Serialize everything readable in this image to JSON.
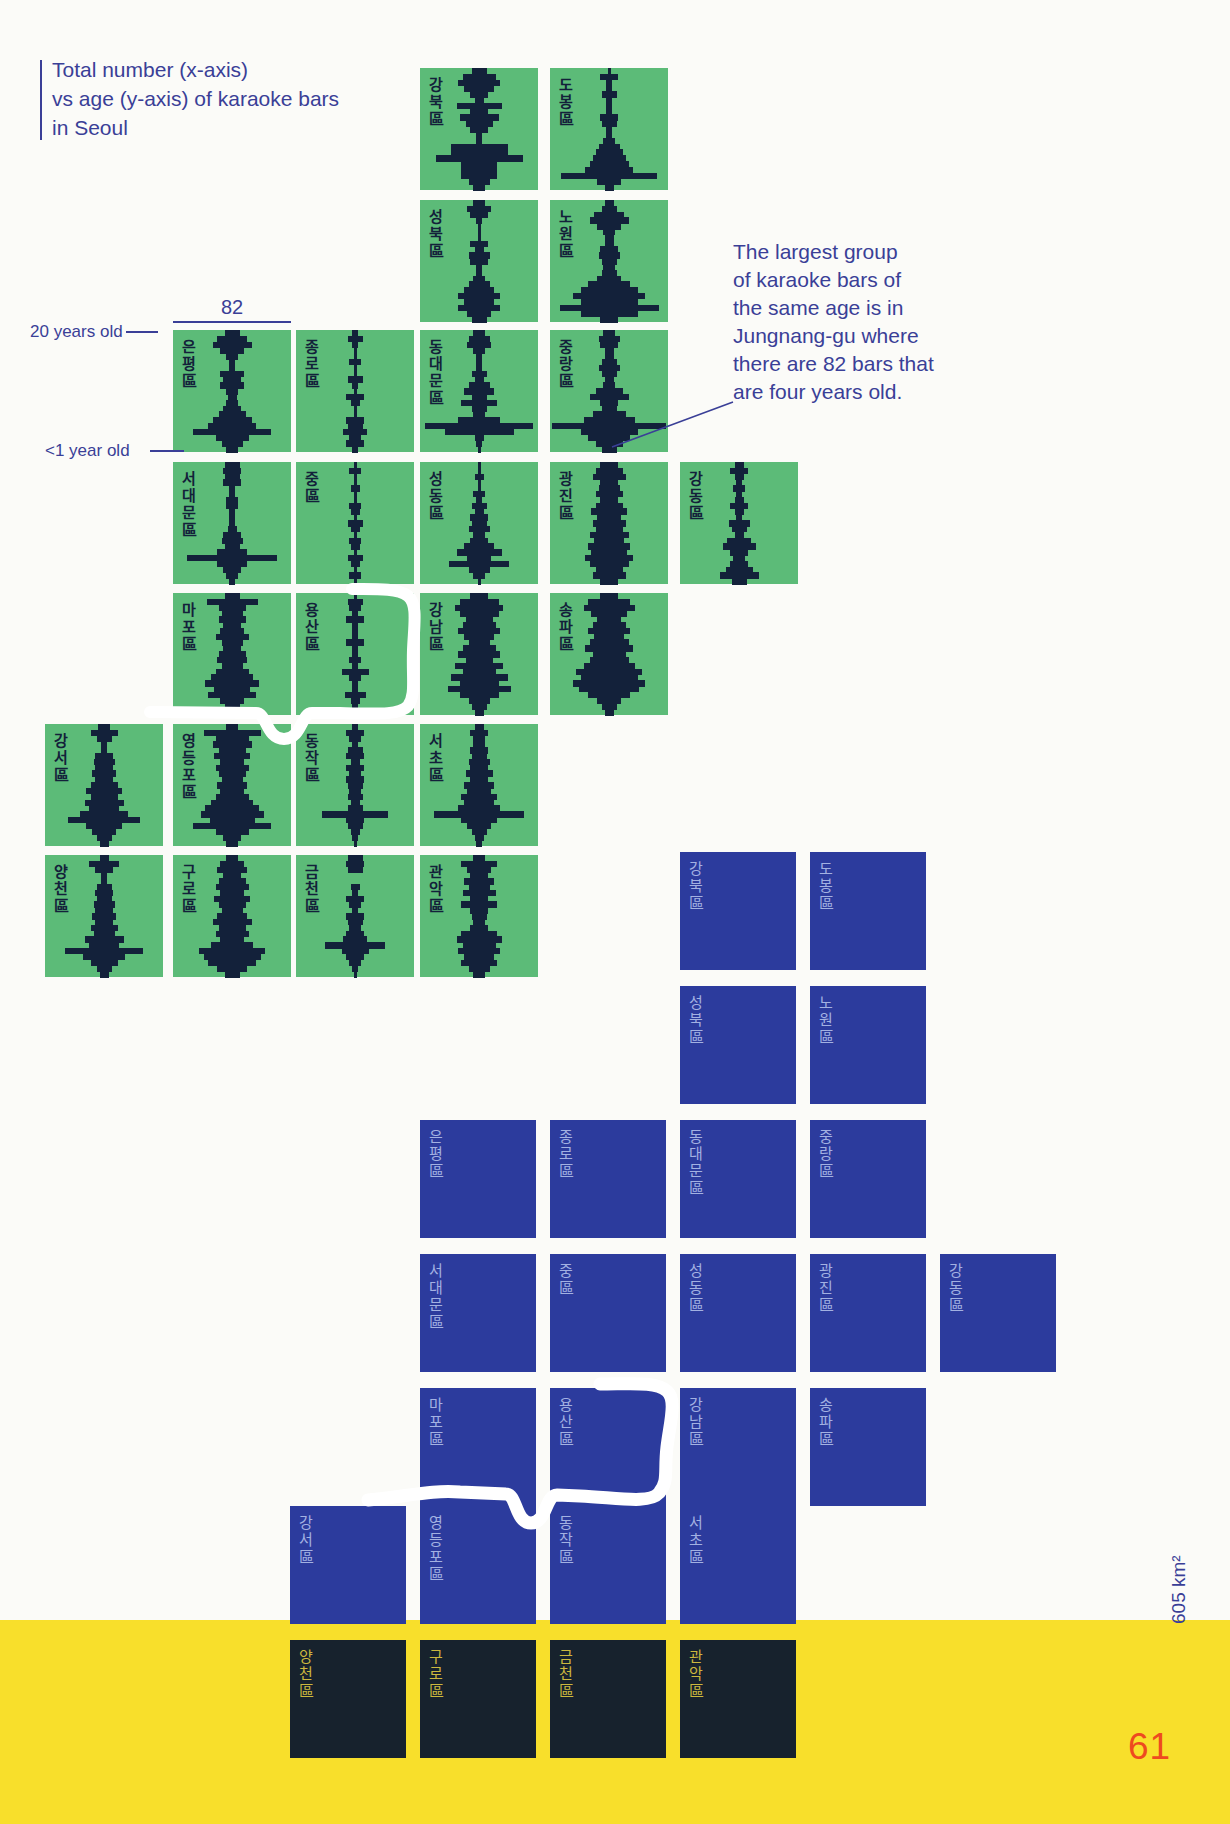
{
  "page": {
    "width": 1230,
    "height": 1824,
    "number": "61",
    "area_label": "605 km²"
  },
  "colors": {
    "background": "#FBFBF8",
    "text_blue": "#3A3F97",
    "green_tile": "#5CBB78",
    "histogram_navy": "#13213A",
    "blue_tile": "#2C3B9D",
    "blue_tile_label": "#A3B1E2",
    "dark_tile": "#17222D",
    "dark_tile_label": "#CCB83E",
    "band_yellow": "#F8DF2B",
    "page_number_red": "#EE4A1F",
    "river_white": "#FFFFFF"
  },
  "title": {
    "lines": [
      "Total number (x-axis)",
      "vs age (y-axis) of karaoke bars",
      "in Seoul"
    ]
  },
  "axis_annotations": {
    "top": "20 years old",
    "bottom": "<1 year old",
    "scale_value": "82"
  },
  "callout": {
    "lines": [
      "The largest group",
      "of karaoke bars of",
      "the same age is in",
      "Jungnang-gu where",
      "there are 82 bars that",
      "are four years old."
    ]
  },
  "layout": {
    "green": {
      "cols": [
        45,
        173,
        296,
        420,
        550,
        680
      ],
      "rows": [
        68,
        200,
        330,
        462,
        593,
        724,
        855
      ],
      "tile_w": 118,
      "tile_h": 122
    },
    "blue": {
      "cols": [
        290,
        420,
        550,
        680,
        810,
        940
      ],
      "rows": [
        852,
        986,
        1120,
        1254,
        1388,
        1506,
        1640
      ],
      "tile_w": 116,
      "tile_h": 118
    }
  },
  "chart_data": {
    "type": "bar",
    "subtype": "small-multiple horizontal histograms arranged as a tile-grid map of Seoul districts, duplicated below as a plain blue tile-grid map",
    "title": "Total number (x-axis) vs age (y-axis) of karaoke bars in Seoul",
    "xlabel": "Total number of karaoke bars",
    "ylabel": "Age of bars: 20 years old (top) to <1 year old (bottom)",
    "xlim": [
      0,
      82
    ],
    "age_bins_top_to_bottom": 21,
    "highlight": {
      "district": "Jungnang-gu",
      "district_ko": "중랑區",
      "value": 82,
      "age_years": 4
    },
    "districts": [
      {
        "id": "gangbuk",
        "label": "강북區",
        "col": 3,
        "row": 0,
        "values": [
          10,
          24,
          30,
          22,
          14,
          6,
          32,
          12,
          28,
          20,
          12,
          5,
          5,
          40,
          40,
          62,
          26,
          26,
          26,
          16,
          8
        ]
      },
      {
        "id": "dobong",
        "label": "도봉區",
        "col": 4,
        "row": 0,
        "values": [
          3,
          14,
          4,
          4,
          10,
          4,
          4,
          4,
          12,
          10,
          5,
          5,
          8,
          16,
          20,
          24,
          28,
          34,
          70,
          18,
          6
        ]
      },
      {
        "id": "seongbuk",
        "label": "성북區",
        "col": 3,
        "row": 1,
        "values": [
          8,
          18,
          14,
          4,
          3,
          3,
          3,
          12,
          6,
          16,
          12,
          5,
          5,
          8,
          16,
          22,
          30,
          22,
          30,
          18,
          10
        ]
      },
      {
        "id": "nowon",
        "label": "노원區",
        "col": 4,
        "row": 1,
        "values": [
          6,
          10,
          22,
          28,
          18,
          8,
          6,
          6,
          12,
          16,
          10,
          8,
          10,
          18,
          30,
          40,
          52,
          40,
          72,
          40,
          14
        ]
      },
      {
        "id": "eunpyeong",
        "label": "은평區",
        "col": 1,
        "row": 2,
        "values": [
          10,
          22,
          28,
          18,
          8,
          5,
          5,
          18,
          14,
          18,
          8,
          6,
          8,
          14,
          20,
          28,
          34,
          56,
          24,
          16,
          8
        ]
      },
      {
        "id": "jongno",
        "label": "종로區",
        "col": 2,
        "row": 2,
        "values": [
          4,
          10,
          4,
          3,
          3,
          8,
          3,
          3,
          10,
          4,
          3,
          12,
          6,
          3,
          3,
          14,
          10,
          18,
          8,
          12,
          4
        ]
      },
      {
        "id": "dongdaemun",
        "label": "동대문區",
        "col": 3,
        "row": 2,
        "values": [
          8,
          16,
          18,
          8,
          4,
          4,
          4,
          10,
          6,
          16,
          22,
          10,
          26,
          10,
          8,
          30,
          78,
          50,
          6,
          4,
          3
        ]
      },
      {
        "id": "jungnang",
        "label": "중랑區",
        "col": 4,
        "row": 2,
        "values": [
          8,
          16,
          12,
          6,
          6,
          10,
          16,
          10,
          6,
          8,
          20,
          28,
          14,
          10,
          24,
          36,
          82,
          40,
          30,
          20,
          10
        ]
      },
      {
        "id": "seodaemun",
        "label": "서대문區",
        "col": 1,
        "row": 3,
        "values": [
          10,
          14,
          10,
          14,
          4,
          4,
          8,
          8,
          4,
          4,
          4,
          6,
          14,
          16,
          10,
          22,
          64,
          22,
          14,
          8,
          4
        ]
      },
      {
        "id": "jung",
        "label": "중區",
        "col": 2,
        "row": 3,
        "values": [
          3,
          8,
          3,
          3,
          6,
          3,
          3,
          8,
          6,
          3,
          10,
          6,
          3,
          8,
          6,
          3,
          10,
          6,
          3,
          8,
          3
        ]
      },
      {
        "id": "seongdong",
        "label": "성동區",
        "col": 3,
        "row": 3,
        "values": [
          3,
          3,
          6,
          3,
          3,
          8,
          4,
          10,
          6,
          14,
          10,
          16,
          8,
          12,
          22,
          32,
          18,
          44,
          16,
          8,
          3
        ]
      },
      {
        "id": "gwangjin",
        "label": "광진區",
        "col": 4,
        "row": 3,
        "values": [
          12,
          20,
          24,
          12,
          16,
          20,
          14,
          20,
          26,
          18,
          24,
          20,
          28,
          22,
          30,
          26,
          34,
          28,
          20,
          24,
          12
        ]
      },
      {
        "id": "gangdong",
        "label": "강동區",
        "col": 5,
        "row": 3,
        "values": [
          6,
          12,
          6,
          4,
          8,
          4,
          6,
          14,
          6,
          4,
          16,
          10,
          6,
          18,
          24,
          12,
          8,
          14,
          20,
          28,
          10
        ]
      },
      {
        "id": "mapo",
        "label": "마포區",
        "col": 1,
        "row": 4,
        "values": [
          10,
          36,
          20,
          16,
          20,
          14,
          18,
          24,
          16,
          12,
          20,
          22,
          16,
          24,
          30,
          38,
          26,
          34,
          18,
          10,
          6
        ]
      },
      {
        "id": "yongsan",
        "label": "용산區",
        "col": 2,
        "row": 4,
        "values": [
          3,
          10,
          8,
          4,
          12,
          4,
          4,
          4,
          14,
          4,
          4,
          8,
          4,
          20,
          8,
          4,
          4,
          16,
          6,
          4,
          3
        ]
      },
      {
        "id": "gangnam",
        "label": "강남區",
        "col": 3,
        "row": 4,
        "values": [
          14,
          28,
          34,
          28,
          20,
          24,
          30,
          22,
          16,
          24,
          30,
          20,
          34,
          24,
          40,
          28,
          46,
          28,
          16,
          10,
          6
        ]
      },
      {
        "id": "songpa",
        "label": "송파區",
        "col": 4,
        "row": 4,
        "values": [
          12,
          30,
          36,
          26,
          18,
          24,
          30,
          22,
          28,
          34,
          24,
          28,
          36,
          48,
          40,
          52,
          44,
          30,
          18,
          10,
          6
        ]
      },
      {
        "id": "gangseo",
        "label": "강서區",
        "col": 0,
        "row": 5,
        "values": [
          8,
          20,
          10,
          5,
          5,
          12,
          16,
          12,
          18,
          14,
          20,
          26,
          20,
          28,
          22,
          34,
          52,
          26,
          18,
          10,
          6
        ]
      },
      {
        "id": "yeongdeungpo",
        "label": "영등포區",
        "col": 1,
        "row": 5,
        "values": [
          8,
          40,
          24,
          28,
          20,
          26,
          18,
          24,
          20,
          16,
          22,
          18,
          24,
          30,
          38,
          46,
          32,
          56,
          24,
          14,
          8
        ]
      },
      {
        "id": "dongjak",
        "label": "동작區",
        "col": 2,
        "row": 5,
        "values": [
          4,
          14,
          8,
          5,
          10,
          14,
          6,
          12,
          8,
          14,
          10,
          8,
          10,
          6,
          10,
          48,
          14,
          10,
          6,
          4,
          3
        ]
      },
      {
        "id": "seocho",
        "label": "서초區",
        "col": 3,
        "row": 5,
        "values": [
          6,
          12,
          8,
          8,
          14,
          10,
          16,
          12,
          20,
          14,
          22,
          18,
          26,
          22,
          30,
          64,
          26,
          18,
          10,
          6,
          4
        ]
      },
      {
        "id": "yangcheon",
        "label": "양천區",
        "col": 0,
        "row": 6,
        "values": [
          6,
          22,
          12,
          5,
          5,
          10,
          14,
          10,
          16,
          12,
          18,
          14,
          20,
          16,
          28,
          22,
          56,
          30,
          20,
          10,
          6
        ]
      },
      {
        "id": "guro",
        "label": "구로區",
        "col": 1,
        "row": 6,
        "values": [
          8,
          18,
          22,
          14,
          20,
          24,
          18,
          26,
          20,
          16,
          22,
          28,
          20,
          24,
          18,
          30,
          48,
          40,
          34,
          22,
          10
        ]
      },
      {
        "id": "geumcheon",
        "label": "금천區",
        "col": 2,
        "row": 6,
        "values": [
          10,
          14,
          10,
          0,
          0,
          6,
          4,
          12,
          8,
          4,
          14,
          10,
          8,
          12,
          18,
          44,
          20,
          14,
          8,
          4,
          3
        ]
      },
      {
        "id": "gwanak",
        "label": "관악區",
        "col": 3,
        "row": 6,
        "values": [
          8,
          26,
          18,
          12,
          22,
          16,
          24,
          12,
          26,
          14,
          10,
          8,
          12,
          26,
          32,
          24,
          30,
          22,
          26,
          16,
          8
        ]
      }
    ]
  }
}
